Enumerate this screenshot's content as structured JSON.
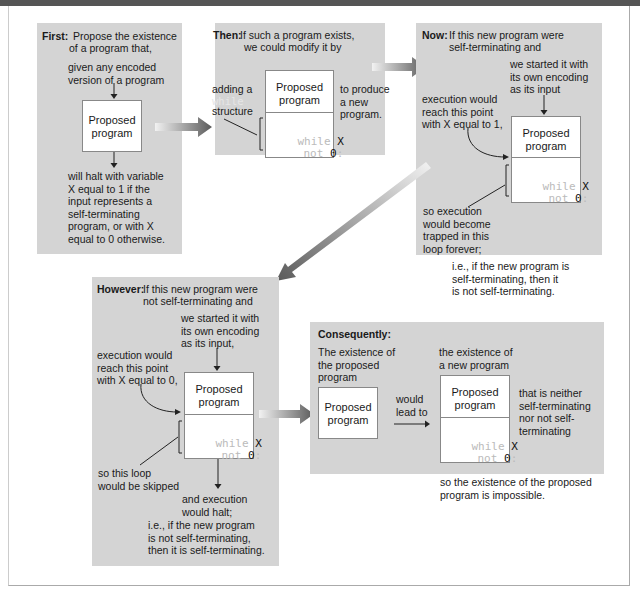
{
  "panels": {
    "first": {
      "heading": "First:",
      "line1": "Propose the existence",
      "line2": "of a program that,",
      "input_note": "given any encoded\nversion of a program",
      "box_label": "Proposed\nprogram",
      "output_note": "will halt with variable\nX equal to 1 if the\ninput represents a\nself-terminating\nprogram, or with X\nequal to 0 otherwise."
    },
    "then": {
      "heading": "Then:",
      "line1": "If such a program exists,",
      "line2": "we could modify it by",
      "left_note_1": "adding a",
      "left_note_kw": "while",
      "left_note_2": "structure",
      "right_note": "to produce\na new\nprogram.",
      "box_label": "Proposed\nprogram",
      "code_kw1": "while",
      "code_var": "X",
      "code_kw2": "not",
      "code_val": "0",
      "code_colon": ":"
    },
    "now": {
      "heading": "Now:",
      "line1": "If this new program were",
      "line2": "self-terminating and",
      "input_note": "we started it with\nits own encoding\nas its input",
      "reach_note": "execution would\nreach this point\nwith X equal to 1,",
      "box_label": "Proposed\nprogram",
      "code_kw1": "while",
      "code_var": "X",
      "code_kw2": "not",
      "code_val": "0",
      "code_colon": ":",
      "trapped_note": "so execution\nwould become\ntrapped in this\nloop forever;",
      "conclusion": "i.e., if the new program is\nself-terminating, then it\nis not self-terminating."
    },
    "however": {
      "heading": "However:",
      "line1": "If this new program were",
      "line2": "not self-terminating and",
      "input_note": "we started it with\nits own encoding\nas its input,",
      "reach_note": "execution would\nreach this point\nwith X equal to 0,",
      "box_label": "Proposed\nprogram",
      "code_kw1": "while",
      "code_var": "X",
      "code_kw2": "not",
      "code_val": "0",
      "code_colon": ":",
      "skipped_note": "so this loop\nwould be skipped",
      "halt_note": "and execution\nwould halt;",
      "conclusion": "i.e., if the new program\nis not self-terminating,\nthen it is self-terminating."
    },
    "consequently": {
      "heading": "Consequently:",
      "left_note": "The existence of\nthe proposed\nprogram",
      "left_box_label": "Proposed\nprogram",
      "lead_note": "would\nlead to",
      "right_note": "the existence of\na new program",
      "right_box_label": "Proposed\nprogram",
      "code_kw1": "while",
      "code_var": "X",
      "code_kw2": "not",
      "code_val": "0",
      "code_colon": ":",
      "neither_note": "that is neither\nself-terminating\nnor not self-\nterminating",
      "final_note": "so the existence of the proposed\nprogram is impossible."
    }
  },
  "colors": {
    "panel_bg": "#d4d4d4",
    "arrow_dark": "#666666",
    "code_keyword": "#bbbbbb"
  }
}
